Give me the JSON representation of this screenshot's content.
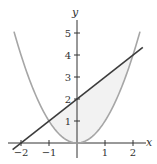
{
  "chart_data": {
    "type": "line",
    "title": "",
    "xlabel": "x",
    "ylabel": "y",
    "xlim": [
      -2.3,
      2.35
    ],
    "ylim": [
      -0.3,
      5.5
    ],
    "grid": false,
    "legend": null,
    "x_ticks": [
      -2,
      -1,
      1,
      2
    ],
    "x_tick_labels": [
      "−2",
      "−1",
      "1",
      "2"
    ],
    "y_ticks": [
      1,
      2,
      3,
      4,
      5
    ],
    "y_tick_labels": [
      "1",
      "2",
      "3",
      "4",
      "5"
    ],
    "series": [
      {
        "name": "parabola",
        "expression": "y = x^2",
        "color": "#a6a6a6",
        "x": [
          -2.25,
          -2,
          -1.5,
          -1,
          -0.5,
          0,
          0.5,
          1,
          1.5,
          2,
          2.25
        ],
        "y": [
          5.06,
          4,
          2.25,
          1,
          0.25,
          0,
          0.25,
          1,
          2.25,
          4,
          5.06
        ]
      },
      {
        "name": "line",
        "expression": "y = x + 2",
        "color": "#3c3c3c",
        "x": [
          -2.3,
          -2,
          -1,
          0,
          1,
          2,
          2.35
        ],
        "y": [
          -0.3,
          0,
          1,
          2,
          3,
          4,
          4.35
        ]
      }
    ],
    "shaded_region": {
      "between": [
        "line",
        "parabola"
      ],
      "x_range": [
        -1,
        2
      ],
      "color": "#f2f2f2"
    },
    "intersections": [
      [
        -1,
        1
      ],
      [
        2,
        4
      ]
    ]
  },
  "axes": {
    "x_label": "x",
    "y_label": "y",
    "x_tick_labels": [
      "−2",
      "−1",
      "1",
      "2"
    ],
    "y_tick_labels": [
      "1",
      "2",
      "3",
      "4",
      "5"
    ]
  }
}
